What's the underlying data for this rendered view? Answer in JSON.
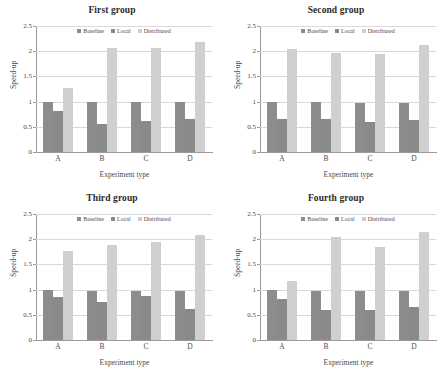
{
  "figure": {
    "panels": [
      "first",
      "second",
      "third",
      "fourth"
    ]
  },
  "chart_data": [
    {
      "type": "bar",
      "title": "First group",
      "xlabel": "Experiment type",
      "ylabel": "Speed-up",
      "categories": [
        "A",
        "B",
        "C",
        "D"
      ],
      "ylim": [
        0,
        2.5
      ],
      "yticks": [
        "0",
        "0.5",
        "1",
        "1.5",
        "2",
        "2.5"
      ],
      "grid": true,
      "legend_position": "top-center",
      "series": [
        {
          "name": "Baseline",
          "color": "#8c8c8c",
          "values": [
            1.0,
            1.0,
            0.99,
            0.99
          ]
        },
        {
          "name": "Local",
          "color": "#8a8a8a",
          "values": [
            0.82,
            0.55,
            0.61,
            0.66
          ]
        },
        {
          "name": "Distributed",
          "color": "#cfcfcf",
          "values": [
            1.27,
            2.06,
            2.06,
            2.18
          ]
        }
      ]
    },
    {
      "type": "bar",
      "title": "Second group",
      "xlabel": "Experiment type",
      "ylabel": "Speed-up",
      "categories": [
        "A",
        "B",
        "C",
        "D"
      ],
      "ylim": [
        0,
        2.5
      ],
      "yticks": [
        "0",
        "0.5",
        "1",
        "1.5",
        "2",
        "2.5"
      ],
      "grid": true,
      "legend_position": "top-center",
      "series": [
        {
          "name": "Baseline",
          "color": "#8c8c8c",
          "values": [
            1.0,
            1.0,
            0.98,
            0.98
          ]
        },
        {
          "name": "Local",
          "color": "#8a8a8a",
          "values": [
            0.66,
            0.65,
            0.6,
            0.64
          ]
        },
        {
          "name": "Distributed",
          "color": "#cfcfcf",
          "values": [
            2.05,
            1.97,
            1.95,
            2.12
          ]
        }
      ]
    },
    {
      "type": "bar",
      "title": "Third group",
      "xlabel": "Experiment type",
      "ylabel": "Speed-up",
      "categories": [
        "A",
        "B",
        "C",
        "D"
      ],
      "ylim": [
        0,
        2.5
      ],
      "yticks": [
        "0",
        "0.5",
        "1",
        "1.5",
        "2",
        "2.5"
      ],
      "grid": true,
      "legend_position": "top-center",
      "series": [
        {
          "name": "Baseline",
          "color": "#8c8c8c",
          "values": [
            1.0,
            0.98,
            0.98,
            0.98
          ]
        },
        {
          "name": "Local",
          "color": "#8a8a8a",
          "values": [
            0.86,
            0.76,
            0.87,
            0.61
          ]
        },
        {
          "name": "Distributed",
          "color": "#cfcfcf",
          "values": [
            1.76,
            1.89,
            1.95,
            2.09
          ]
        }
      ]
    },
    {
      "type": "bar",
      "title": "Fourth group",
      "xlabel": "Experiment type",
      "ylabel": "Speed-up",
      "categories": [
        "A",
        "B",
        "C",
        "D"
      ],
      "ylim": [
        0,
        2.5
      ],
      "yticks": [
        "0",
        "0.5",
        "1",
        "1.5",
        "2",
        "2.5"
      ],
      "grid": true,
      "legend_position": "top-center",
      "series": [
        {
          "name": "Baseline",
          "color": "#8c8c8c",
          "values": [
            1.0,
            0.98,
            0.98,
            0.98
          ]
        },
        {
          "name": "Local",
          "color": "#8a8a8a",
          "values": [
            0.82,
            0.59,
            0.6,
            0.66
          ]
        },
        {
          "name": "Distributed",
          "color": "#cfcfcf",
          "values": [
            1.17,
            2.05,
            1.85,
            2.14
          ]
        }
      ]
    }
  ]
}
